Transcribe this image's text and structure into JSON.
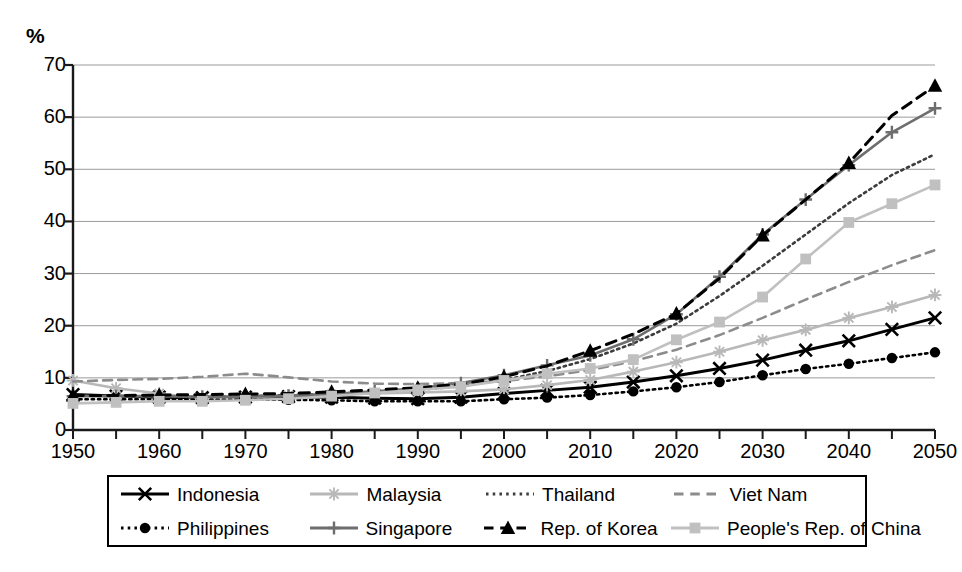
{
  "chart_data": {
    "type": "line",
    "title": "",
    "subtitle": "",
    "xlabel": "",
    "ylabel": "%",
    "ylim": [
      0,
      70
    ],
    "xlim": [
      1950,
      2050
    ],
    "ytick_labels": [
      "70",
      "60",
      "50",
      "40",
      "30",
      "20",
      "10",
      "0"
    ],
    "yticks": [
      70,
      60,
      50,
      40,
      30,
      20,
      10,
      0
    ],
    "xtick_labels": [
      "1950",
      "1960",
      "1970",
      "1980",
      "1990",
      "2000",
      "2010",
      "2020",
      "2030",
      "2040",
      "2050"
    ],
    "xticks": [
      1950,
      1960,
      1970,
      1980,
      1990,
      2000,
      2010,
      2020,
      2030,
      2040,
      2050
    ],
    "minor_xtick_step": 5,
    "grid": "horizontal",
    "legend_position": "bottom",
    "x": [
      1950,
      1955,
      1960,
      1965,
      1970,
      1975,
      1980,
      1985,
      1990,
      1995,
      2000,
      2005,
      2010,
      2015,
      2020,
      2025,
      2030,
      2035,
      2040,
      2045,
      2050
    ],
    "series": [
      {
        "name": "Indonesia",
        "color": "#000000",
        "marker": "x",
        "dash": "solid",
        "values": [
          6.8,
          6.5,
          6.3,
          6.2,
          6.3,
          6.4,
          6.3,
          6.1,
          6.0,
          6.3,
          7.0,
          7.6,
          8.2,
          9.2,
          10.4,
          11.8,
          13.4,
          15.3,
          17.1,
          19.3,
          21.5
        ]
      },
      {
        "name": "Malaysia",
        "color": "#b8b8b8",
        "marker": "star",
        "dash": "solid",
        "values": [
          9.5,
          8.0,
          7.0,
          6.0,
          6.3,
          6.6,
          6.8,
          7.0,
          7.2,
          7.4,
          7.8,
          8.6,
          9.6,
          11.2,
          13.0,
          15.0,
          17.2,
          19.2,
          21.5,
          23.6,
          25.9
        ]
      },
      {
        "name": "Thailand",
        "color": "#3c3c3c",
        "marker": "none",
        "dash": "dotted",
        "values": [
          6.6,
          6.5,
          6.4,
          6.3,
          6.5,
          6.7,
          6.9,
          7.3,
          7.7,
          8.4,
          9.6,
          11.3,
          13.6,
          16.6,
          20.4,
          25.7,
          31.5,
          37.5,
          43.5,
          48.9,
          52.9
        ]
      },
      {
        "name": "Viet Nam",
        "color": "#8c8c8c",
        "marker": "none",
        "dash": "dashed",
        "values": [
          9.3,
          9.6,
          9.8,
          10.2,
          10.8,
          10.1,
          9.3,
          8.9,
          8.8,
          9.0,
          9.4,
          10.3,
          11.5,
          13.2,
          15.4,
          18.2,
          21.5,
          25.0,
          28.4,
          31.6,
          34.5
        ]
      },
      {
        "name": "Philippines",
        "color": "#000000",
        "marker": "circle",
        "dash": "dotted",
        "values": [
          5.9,
          5.9,
          5.9,
          5.8,
          5.8,
          5.8,
          5.7,
          5.5,
          5.5,
          5.5,
          5.9,
          6.2,
          6.7,
          7.4,
          8.2,
          9.2,
          10.5,
          11.7,
          12.7,
          13.8,
          14.9
        ]
      },
      {
        "name": "Singapore",
        "color": "#6e6e6e",
        "marker": "plus",
        "dash": "solid",
        "values": [
          6.5,
          6.5,
          6.5,
          6.4,
          6.4,
          6.6,
          6.9,
          7.4,
          8.0,
          9.0,
          10.5,
          12.4,
          14.3,
          17.4,
          22.2,
          29.4,
          37.5,
          44.2,
          50.8,
          57.1,
          61.7
        ]
      },
      {
        "name": "Rep. of Korea",
        "color": "#000000",
        "marker": "triangle",
        "dash": "dashed",
        "values": [
          6.6,
          6.6,
          6.7,
          6.8,
          6.9,
          7.0,
          7.3,
          7.7,
          8.1,
          8.8,
          10.2,
          12.3,
          15.2,
          18.4,
          22.3,
          29.1,
          37.3,
          44.2,
          51.2,
          60.3,
          66.0
        ]
      },
      {
        "name": "People's Rep. of China",
        "color": "#c0c0c0",
        "marker": "square",
        "dash": "solid",
        "values": [
          5.1,
          5.3,
          5.5,
          5.5,
          5.7,
          6.0,
          6.5,
          7.1,
          7.7,
          8.3,
          9.5,
          10.8,
          11.8,
          13.5,
          17.3,
          20.7,
          25.5,
          32.8,
          39.8,
          43.4,
          47.0
        ]
      }
    ]
  },
  "legend": {
    "rows": [
      [
        {
          "label": "Indonesia",
          "key": "Indonesia"
        },
        {
          "label": "Malaysia",
          "key": "Malaysia"
        },
        {
          "label": "Thailand",
          "key": "Thailand"
        },
        {
          "label": "Viet Nam",
          "key": "Viet Nam"
        }
      ],
      [
        {
          "label": "Philippines",
          "key": "Philippines"
        },
        {
          "label": "Singapore",
          "key": "Singapore"
        },
        {
          "label": "Rep. of Korea",
          "key": "Rep. of Korea"
        },
        {
          "label": "People's Rep. of China",
          "key": "People's Rep. of China"
        }
      ]
    ]
  },
  "colors": {
    "axis": "#1a1a1a",
    "grid": "#9a9a9a",
    "background": "#ffffff"
  }
}
